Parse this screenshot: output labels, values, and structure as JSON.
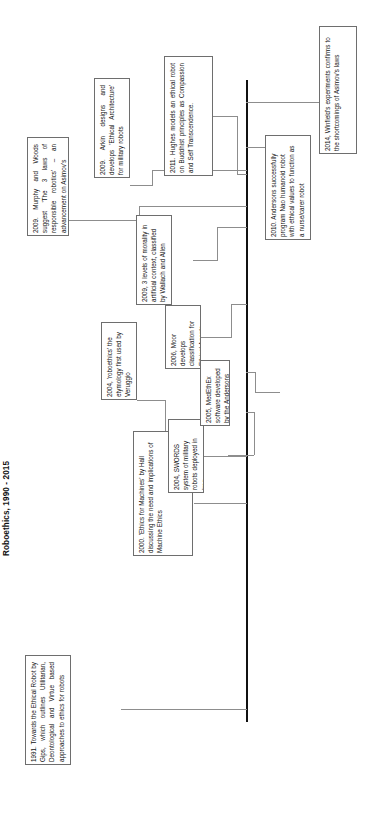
{
  "title": "Roboethics, 1990 - 2015",
  "diagram": {
    "type": "timeline",
    "axis_label": "timeline-spine",
    "span_start": "1990",
    "span_end": "2015"
  },
  "events": [
    {
      "id": "event-1991-towards-ethical-robot",
      "year": "1991",
      "text": "1991.  Towards  the  Ethical Robot by Gips, which outlines Utilitarian,  Deontological  and Virtue  based  approaches  to ethics for robots"
    },
    {
      "id": "event-2000-ethics-for-machines",
      "year": "2000",
      "text": "2000. 'Ethics for Machines' by Hall discussing the need and implications of Machine Ethics"
    },
    {
      "id": "event-2004-roboethics-etymology",
      "year": "2004",
      "text": "2004, 'roboethics' the etymology first used by Veruggio"
    },
    {
      "id": "event-2004-swords-iraq",
      "year": "2004",
      "text": "2004, SWORDS system of military robots deployed in Iraq"
    },
    {
      "id": "event-2005-medethex",
      "year": "2005",
      "text": "2005, MedEthEx software developed by the Andersons"
    },
    {
      "id": "event-2006-moor-classification",
      "year": "2006",
      "text": "2006, Moor  develops classification for Ethical Agents"
    },
    {
      "id": "event-2009-levels-of-morality",
      "year": "2009",
      "text": "2009, 3 levels of morality in artificial context, classified by Wallach and Allen"
    },
    {
      "id": "event-2009-murphy-woods",
      "year": "2009",
      "text": "2009.  Murphy  and  Woods suggest  'The  3  laws  of responsible  robotics'  –  an advancement on Asimov's"
    },
    {
      "id": "event-2009-arkin-ethical-architecture",
      "year": "2009",
      "text": "2009.   Arkin   designs   and develops 'Ethical Architecture' for military robots"
    },
    {
      "id": "event-2010-andersons-nao",
      "year": "2010",
      "text": "2010.  Andersons  successfully program Nao humanoid robot with ethical values to function as a nurse/carer robot"
    },
    {
      "id": "event-2011-hughes-buddhist",
      "year": "2011",
      "text": "2011.   Hughes   models   an ethical   robot   on   Buddhist principles as Compassion and Self Transcendence."
    },
    {
      "id": "event-2014-winfield-experiments",
      "year": "2014",
      "text": "2014, Winfield's experiments confirms to the shortcomings of Asimov's laws"
    }
  ]
}
